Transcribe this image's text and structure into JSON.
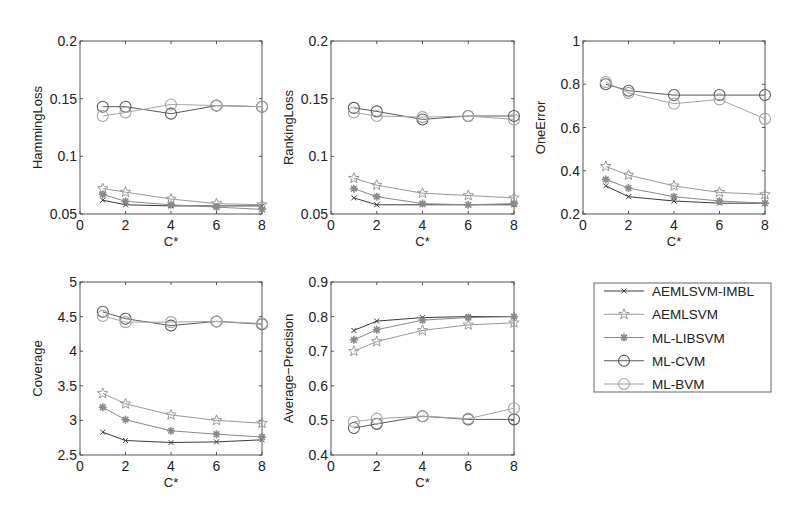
{
  "figure": {
    "legend": {
      "entries": [
        {
          "label": "AEMLSVM-IMBL",
          "marker": "x-icon",
          "color": "#3a3a3a"
        },
        {
          "label": "AEMLSVM",
          "marker": "star-icon",
          "color": "#9a9a9a"
        },
        {
          "label": "ML-LIBSVM",
          "marker": "asterisk-icon",
          "color": "#8a8a8a"
        },
        {
          "label": "ML-CVM",
          "marker": "circle-icon",
          "color": "#5a5a5a"
        },
        {
          "label": "ML-BVM",
          "marker": "circle-icon",
          "color": "#a5a5a5"
        }
      ]
    }
  },
  "chart_data": [
    {
      "type": "line",
      "title": "",
      "xlabel": "C*",
      "ylabel": "HammingLoss",
      "x": [
        1,
        2,
        4,
        6,
        8
      ],
      "xlim": [
        0,
        8
      ],
      "xticks": [
        "0",
        "2",
        "4",
        "6",
        "8"
      ],
      "ylim": [
        0.05,
        0.2
      ],
      "yticks": [
        "0.05",
        "0.1",
        "0.15",
        "0.2"
      ],
      "grid": false,
      "series": [
        {
          "name": "AEMLSVM-IMBL",
          "values": [
            0.062,
            0.058,
            0.057,
            0.057,
            0.057
          ]
        },
        {
          "name": "AEMLSVM",
          "values": [
            0.072,
            0.069,
            0.063,
            0.059,
            0.058
          ]
        },
        {
          "name": "ML-LIBSVM",
          "values": [
            0.067,
            0.061,
            0.058,
            0.056,
            0.054
          ]
        },
        {
          "name": "ML-CVM",
          "values": [
            0.143,
            0.143,
            0.137,
            0.144,
            0.143
          ]
        },
        {
          "name": "ML-BVM",
          "values": [
            0.135,
            0.138,
            0.145,
            0.144,
            0.143
          ]
        }
      ]
    },
    {
      "type": "line",
      "title": "",
      "xlabel": "C*",
      "ylabel": "RankingLoss",
      "x": [
        1,
        2,
        4,
        6,
        8
      ],
      "xlim": [
        0,
        8
      ],
      "xticks": [
        "0",
        "2",
        "4",
        "6",
        "8"
      ],
      "ylim": [
        0.05,
        0.2
      ],
      "yticks": [
        "0.05",
        "0.1",
        "0.15",
        "0.2"
      ],
      "grid": false,
      "series": [
        {
          "name": "AEMLSVM-IMBL",
          "values": [
            0.064,
            0.058,
            0.058,
            0.058,
            0.058
          ]
        },
        {
          "name": "AEMLSVM",
          "values": [
            0.081,
            0.075,
            0.068,
            0.066,
            0.064
          ]
        },
        {
          "name": "ML-LIBSVM",
          "values": [
            0.072,
            0.065,
            0.059,
            0.058,
            0.059
          ]
        },
        {
          "name": "ML-CVM",
          "values": [
            0.142,
            0.139,
            0.132,
            0.135,
            0.135
          ]
        },
        {
          "name": "ML-BVM",
          "values": [
            0.138,
            0.135,
            0.134,
            0.135,
            0.132
          ]
        }
      ]
    },
    {
      "type": "line",
      "title": "",
      "xlabel": "C*",
      "ylabel": "OneError",
      "x": [
        1,
        2,
        4,
        6,
        8
      ],
      "xlim": [
        0,
        8
      ],
      "xticks": [
        "0",
        "2",
        "4",
        "6",
        "8"
      ],
      "ylim": [
        0.2,
        1
      ],
      "yticks": [
        "0.2",
        "0.4",
        "0.6",
        "0.8",
        "1"
      ],
      "grid": false,
      "series": [
        {
          "name": "AEMLSVM-IMBL",
          "values": [
            0.33,
            0.28,
            0.26,
            0.25,
            0.25
          ]
        },
        {
          "name": "AEMLSVM",
          "values": [
            0.42,
            0.38,
            0.33,
            0.3,
            0.29
          ]
        },
        {
          "name": "ML-LIBSVM",
          "values": [
            0.36,
            0.32,
            0.28,
            0.26,
            0.25
          ]
        },
        {
          "name": "ML-CVM",
          "values": [
            0.8,
            0.77,
            0.75,
            0.75,
            0.75
          ]
        },
        {
          "name": "ML-BVM",
          "values": [
            0.81,
            0.76,
            0.71,
            0.73,
            0.64
          ]
        }
      ]
    },
    {
      "type": "line",
      "title": "",
      "xlabel": "C*",
      "ylabel": "Coverage",
      "x": [
        1,
        2,
        4,
        6,
        8
      ],
      "xlim": [
        0,
        8
      ],
      "xticks": [
        "0",
        "2",
        "4",
        "6",
        "8"
      ],
      "ylim": [
        2.5,
        5
      ],
      "yticks": [
        "2.5",
        "3",
        "3.5",
        "4",
        "4.5",
        "5"
      ],
      "grid": false,
      "series": [
        {
          "name": "AEMLSVM-IMBL",
          "values": [
            2.83,
            2.71,
            2.68,
            2.69,
            2.72
          ]
        },
        {
          "name": "AEMLSVM",
          "values": [
            3.39,
            3.24,
            3.08,
            3.0,
            2.96
          ]
        },
        {
          "name": "ML-LIBSVM",
          "values": [
            3.19,
            3.01,
            2.85,
            2.8,
            2.76
          ]
        },
        {
          "name": "ML-CVM",
          "values": [
            4.57,
            4.47,
            4.37,
            4.43,
            4.39
          ]
        },
        {
          "name": "ML-BVM",
          "values": [
            4.51,
            4.42,
            4.42,
            4.43,
            4.4
          ]
        }
      ]
    },
    {
      "type": "line",
      "title": "",
      "xlabel": "C*",
      "ylabel": "Average−Precision",
      "x": [
        1,
        2,
        4,
        6,
        8
      ],
      "xlim": [
        0,
        8
      ],
      "xticks": [
        "0",
        "2",
        "4",
        "6",
        "8"
      ],
      "ylim": [
        0.4,
        0.9
      ],
      "yticks": [
        "0.4",
        "0.5",
        "0.6",
        "0.7",
        "0.8",
        "0.9"
      ],
      "grid": false,
      "series": [
        {
          "name": "AEMLSVM-IMBL",
          "values": [
            0.76,
            0.787,
            0.797,
            0.8,
            0.8
          ]
        },
        {
          "name": "AEMLSVM",
          "values": [
            0.7,
            0.728,
            0.76,
            0.776,
            0.782
          ]
        },
        {
          "name": "ML-LIBSVM",
          "values": [
            0.733,
            0.762,
            0.79,
            0.797,
            0.8
          ]
        },
        {
          "name": "ML-CVM",
          "values": [
            0.478,
            0.49,
            0.512,
            0.503,
            0.503
          ]
        },
        {
          "name": "ML-BVM",
          "values": [
            0.496,
            0.505,
            0.512,
            0.505,
            0.535
          ]
        }
      ]
    }
  ],
  "layout": {
    "panels": [
      {
        "left": 80,
        "right": 262,
        "top": 41,
        "bottom": 214
      },
      {
        "left": 331,
        "right": 514,
        "top": 41,
        "bottom": 214
      },
      {
        "left": 583,
        "right": 765,
        "top": 41,
        "bottom": 214
      },
      {
        "left": 80,
        "right": 262,
        "top": 282,
        "bottom": 455
      },
      {
        "left": 331,
        "right": 514,
        "top": 282,
        "bottom": 455
      }
    ],
    "legend_box": {
      "left": 594,
      "top": 283,
      "right": 771,
      "bottom": 392
    }
  }
}
